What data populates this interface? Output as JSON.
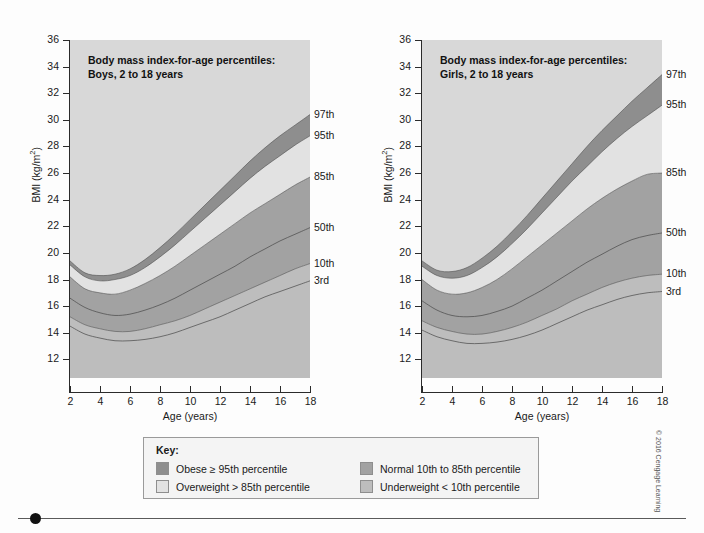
{
  "figure": {
    "copyright": "© 2016 Cengage Learning"
  },
  "panels": [
    {
      "id": "boys",
      "title_line1": "Body mass index-for-age percentiles:",
      "title_line2": "Boys, 2 to 18 years",
      "xlabel": "Age (years)",
      "ylabel_text": "BMI (kg/m",
      "ylabel_sup": "2",
      "ylabel_tail": ")"
    },
    {
      "id": "girls",
      "title_line1": "Body mass index-for-age percentiles:",
      "title_line2": "Girls, 2 to 18 years",
      "xlabel": "Age (years)",
      "ylabel_text": "BMI (kg/m",
      "ylabel_sup": "2",
      "ylabel_tail": ")"
    }
  ],
  "key": {
    "title": "Key:",
    "items": [
      {
        "label": "Obese ≥ 95th percentile",
        "color": "#8e8e8e"
      },
      {
        "label": "Overweight > 85th percentile",
        "color": "#e2e2e2"
      },
      {
        "label": "Normal 10th to 85th percentile",
        "color": "#a2a2a2"
      },
      {
        "label": "Underweight < 10th percentile",
        "color": "#bdbdbd"
      }
    ]
  },
  "colors": {
    "plot_background": "#d8d8d8",
    "gridline": "#f2f2f2",
    "obese": "#8e8e8e",
    "overweight": "#e2e2e2",
    "normal": "#a2a2a2",
    "underweight": "#bdbdbd",
    "curve": "#4a4a4a",
    "axis": "#2b2b2b"
  },
  "chart_data": {
    "type": "area",
    "title": "Body mass index-for-age percentiles",
    "xlabel": "Age (years)",
    "ylabel": "BMI (kg/m2)",
    "xlim": [
      2,
      18
    ],
    "ylim": [
      10.6,
      36
    ],
    "xticks": [
      2,
      4,
      6,
      8,
      10,
      12,
      14,
      16,
      18
    ],
    "yticks": [
      12,
      14,
      16,
      18,
      20,
      22,
      24,
      26,
      28,
      30,
      32,
      34,
      36
    ],
    "grid": true,
    "legend_position": "right-outside",
    "percentile_labels": [
      "97th",
      "95th",
      "85th",
      "50th",
      "10th",
      "3rd"
    ],
    "x": [
      2,
      3,
      4,
      5,
      6,
      7,
      8,
      9,
      10,
      11,
      12,
      13,
      14,
      15,
      16,
      17,
      18
    ],
    "charts": [
      {
        "name": "Boys, 2 to 18 years",
        "series": [
          {
            "name": "97th",
            "values": [
              19.4,
              18.5,
              18.3,
              18.4,
              18.8,
              19.5,
              20.4,
              21.4,
              22.5,
              23.6,
              24.7,
              25.8,
              26.9,
              27.9,
              28.8,
              29.6,
              30.4
            ]
          },
          {
            "name": "95th",
            "values": [
              19.1,
              18.2,
              17.9,
              18.0,
              18.3,
              18.9,
              19.7,
              20.6,
              21.6,
              22.6,
              23.6,
              24.6,
              25.6,
              26.5,
              27.3,
              28.1,
              28.8
            ]
          },
          {
            "name": "85th",
            "values": [
              18.2,
              17.3,
              17.0,
              16.9,
              17.2,
              17.7,
              18.3,
              19.0,
              19.8,
              20.6,
              21.4,
              22.2,
              23.0,
              23.7,
              24.4,
              25.1,
              25.7
            ]
          },
          {
            "name": "50th",
            "values": [
              16.6,
              15.9,
              15.5,
              15.3,
              15.4,
              15.7,
              16.1,
              16.6,
              17.2,
              17.8,
              18.4,
              19.0,
              19.7,
              20.3,
              20.9,
              21.4,
              21.9
            ]
          },
          {
            "name": "10th",
            "values": [
              15.2,
              14.6,
              14.3,
              14.1,
              14.1,
              14.3,
              14.6,
              14.9,
              15.3,
              15.8,
              16.3,
              16.8,
              17.3,
              17.8,
              18.3,
              18.8,
              19.2
            ]
          },
          {
            "name": "3rd",
            "values": [
              14.5,
              13.9,
              13.6,
              13.4,
              13.4,
              13.5,
              13.7,
              14.0,
              14.4,
              14.8,
              15.2,
              15.7,
              16.2,
              16.7,
              17.1,
              17.5,
              17.9
            ]
          }
        ]
      },
      {
        "name": "Girls, 2 to 18 years",
        "series": [
          {
            "name": "97th",
            "values": [
              19.4,
              18.7,
              18.6,
              18.9,
              19.6,
              20.5,
              21.6,
              22.8,
              24.1,
              25.4,
              26.7,
              28.0,
              29.2,
              30.3,
              31.4,
              32.4,
              33.4
            ]
          },
          {
            "name": "95th",
            "values": [
              19.0,
              18.3,
              18.1,
              18.3,
              18.9,
              19.7,
              20.7,
              21.8,
              23.0,
              24.2,
              25.4,
              26.5,
              27.6,
              28.6,
              29.5,
              30.3,
              31.1
            ]
          },
          {
            "name": "85th",
            "values": [
              18.0,
              17.2,
              16.9,
              17.0,
              17.4,
              18.0,
              18.8,
              19.7,
              20.6,
              21.5,
              22.4,
              23.3,
              24.1,
              24.8,
              25.4,
              25.9,
              26.0
            ]
          },
          {
            "name": "50th",
            "values": [
              16.4,
              15.7,
              15.3,
              15.2,
              15.3,
              15.6,
              16.0,
              16.6,
              17.2,
              17.9,
              18.6,
              19.3,
              19.9,
              20.5,
              21.0,
              21.3,
              21.5
            ]
          },
          {
            "name": "10th",
            "values": [
              14.9,
              14.4,
              14.1,
              13.9,
              13.9,
              14.1,
              14.4,
              14.8,
              15.3,
              15.8,
              16.4,
              16.9,
              17.4,
              17.8,
              18.1,
              18.3,
              18.4
            ]
          },
          {
            "name": "3rd",
            "values": [
              14.2,
              13.7,
              13.4,
              13.2,
              13.2,
              13.3,
              13.5,
              13.8,
              14.2,
              14.7,
              15.2,
              15.7,
              16.1,
              16.5,
              16.8,
              17.0,
              17.1
            ]
          }
        ]
      }
    ]
  }
}
